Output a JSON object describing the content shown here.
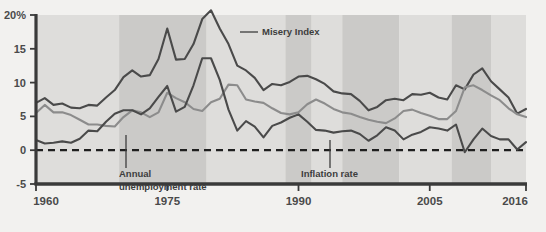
{
  "chart_data": {
    "type": "line",
    "title": "",
    "xlabel": "",
    "ylabel": "",
    "xlim": [
      1960,
      2016
    ],
    "ylim": [
      -5,
      20
    ],
    "grid": false,
    "legend_position": "inline-annotations",
    "y_ticks": [
      "20%",
      "15",
      "10",
      "5",
      "0",
      "-5"
    ],
    "y_tick_values": [
      20,
      15,
      10,
      5,
      0,
      -5
    ],
    "x_ticks": [
      "1960",
      "1975",
      "1990",
      "2005",
      "2016"
    ],
    "x_tick_values": [
      1960,
      1975,
      1990,
      2005,
      2016
    ],
    "zero_line": 0,
    "zero_line_style": "dashed",
    "recession_bands": [
      {
        "start": 1960.0,
        "end": 1969.5,
        "shade": "light"
      },
      {
        "start": 1969.5,
        "end": 1979.5,
        "shade": "dark"
      },
      {
        "start": 1979.5,
        "end": 1988.5,
        "shade": "light"
      },
      {
        "start": 1988.5,
        "end": 1991.5,
        "shade": "dark"
      },
      {
        "start": 1991.5,
        "end": 1995.0,
        "shade": "light"
      },
      {
        "start": 1995.0,
        "end": 2001.5,
        "shade": "dark"
      },
      {
        "start": 2001.5,
        "end": 2007.5,
        "shade": "light"
      },
      {
        "start": 2007.5,
        "end": 2012.0,
        "shade": "dark"
      },
      {
        "start": 2012.0,
        "end": 2016.0,
        "shade": "light"
      }
    ],
    "x": [
      1960,
      1961,
      1962,
      1963,
      1964,
      1965,
      1966,
      1967,
      1968,
      1969,
      1970,
      1971,
      1972,
      1973,
      1974,
      1975,
      1976,
      1977,
      1978,
      1979,
      1980,
      1981,
      1982,
      1983,
      1984,
      1985,
      1986,
      1987,
      1988,
      1989,
      1990,
      1991,
      1992,
      1993,
      1994,
      1995,
      1996,
      1997,
      1998,
      1999,
      2000,
      2001,
      2002,
      2003,
      2004,
      2005,
      2006,
      2007,
      2008,
      2009,
      2010,
      2011,
      2012,
      2013,
      2014,
      2015,
      2016
    ],
    "series": [
      {
        "name": "Misery Index",
        "color": "#4a4a4a",
        "width": 2.1,
        "values": [
          7.0,
          7.7,
          6.7,
          6.9,
          6.3,
          6.2,
          6.7,
          6.6,
          7.8,
          8.9,
          10.8,
          11.8,
          10.9,
          11.1,
          13.5,
          18.0,
          13.4,
          13.5,
          15.7,
          19.4,
          20.7,
          18.0,
          15.7,
          12.5,
          11.8,
          10.7,
          8.9,
          9.8,
          9.6,
          10.1,
          10.9,
          11.0,
          10.5,
          9.8,
          8.7,
          8.4,
          8.3,
          7.3,
          5.9,
          6.4,
          7.4,
          7.6,
          7.4,
          8.3,
          8.2,
          8.5,
          7.8,
          7.5,
          9.6,
          9.0,
          11.2,
          12.1,
          10.2,
          9.0,
          7.8,
          5.4,
          6.1
        ]
      },
      {
        "name": "Annual unemployment rate",
        "color": "#8c8c8c",
        "width": 2.1,
        "values": [
          5.5,
          6.7,
          5.6,
          5.6,
          5.2,
          4.5,
          3.8,
          3.8,
          3.6,
          3.5,
          4.9,
          5.9,
          5.6,
          4.9,
          5.6,
          8.5,
          7.7,
          7.1,
          6.1,
          5.8,
          7.1,
          7.6,
          9.7,
          9.6,
          7.5,
          7.2,
          7.0,
          6.2,
          5.5,
          5.3,
          5.6,
          6.8,
          7.5,
          6.9,
          6.1,
          5.6,
          5.4,
          4.9,
          4.5,
          4.2,
          4.0,
          4.7,
          5.8,
          6.0,
          5.5,
          5.1,
          4.6,
          4.6,
          5.8,
          9.3,
          9.6,
          8.9,
          8.1,
          7.4,
          6.2,
          5.3,
          4.9
        ]
      },
      {
        "name": "Inflation rate",
        "color": "#4a4a4a",
        "width": 2.1,
        "values": [
          1.5,
          1.0,
          1.1,
          1.3,
          1.1,
          1.7,
          2.9,
          2.8,
          4.2,
          5.4,
          5.9,
          5.9,
          5.3,
          6.2,
          7.9,
          9.5,
          5.7,
          6.4,
          9.6,
          13.6,
          13.6,
          10.4,
          6.0,
          2.9,
          4.3,
          3.5,
          1.9,
          3.6,
          4.1,
          4.8,
          5.3,
          4.2,
          3.0,
          2.9,
          2.6,
          2.8,
          2.9,
          2.4,
          1.4,
          2.2,
          3.4,
          2.9,
          1.6,
          2.3,
          2.7,
          3.4,
          3.2,
          2.9,
          3.8,
          -0.3,
          1.6,
          3.2,
          2.1,
          1.6,
          1.6,
          0.1,
          1.2
        ]
      }
    ],
    "annotations": [
      {
        "name": "Misery Index",
        "label": "Misery Index",
        "label_x": 262,
        "label_y": 35,
        "leader": {
          "x1": 240,
          "y1": 32,
          "x2": 258,
          "y2": 32
        },
        "leader_type": "horizontal"
      },
      {
        "name": "Annual unemployment rate",
        "label_line1": "Annual",
        "label_line2": "unemployment rate",
        "label_x": 119,
        "label_y": 177,
        "leader": {
          "x1": 126,
          "y1": 135,
          "x2": 126,
          "y2": 168
        },
        "leader_type": "vertical"
      },
      {
        "name": "Inflation rate",
        "label": "Inflation rate",
        "label_x": 301,
        "label_y": 177,
        "leader": {
          "x1": 330,
          "y1": 140,
          "x2": 330,
          "y2": 168
        },
        "leader_type": "vertical"
      }
    ]
  },
  "colors": {
    "misery": "#4a4a4a",
    "unemployment": "#8c8c8c",
    "inflation": "#4a4a4a",
    "band_light": "#dedddb",
    "band_dark": "#cbcac8",
    "axis": "#3a3a3a",
    "page_background": "#f2f1ef",
    "text": "#4a4a4a"
  }
}
